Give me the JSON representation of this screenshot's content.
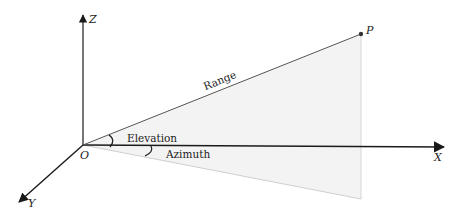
{
  "diagram": {
    "axes": {
      "x_label": "X",
      "y_label": "Y",
      "z_label": "Z",
      "origin_label": "O"
    },
    "point_label": "P",
    "range_label": "Range",
    "elevation_label": "Elevation",
    "azimuth_label": "Azimuth",
    "colors": {
      "axis": "#1a1a1a",
      "range_line": "#555555",
      "plane_fill": "#f3f3f3",
      "plane_edge": "#d6d6d6",
      "point": "#333333"
    }
  }
}
